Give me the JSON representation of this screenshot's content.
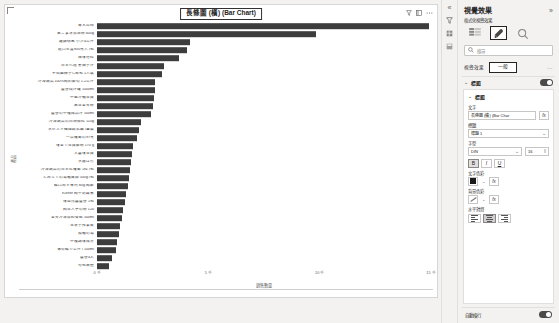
{
  "chart_data": {
    "type": "bar",
    "title": "長條圖 (橫) (Bar Chart)",
    "orientation": "horizontal",
    "xlabel": "銷售數量",
    "ylabel": "產品",
    "xlim": [
      0,
      15000
    ],
    "xticks": [
      "0 千",
      "5 千",
      "10 千",
      "15 千"
    ],
    "grid": false,
    "legend": "none",
    "bar_color": "#3d3d3d",
    "categories": [
      "青木瓜絲",
      "黑ごま冰淇淋粉 600g",
      "鐵鍋燉煮 小沙4公升",
      "進口生薑900克入 /包",
      "辣味噌粒",
      "日本代理 蔥抽子汁",
      "不知園柿子C每包 1入裝",
      "*冷凍蔬菜100%純的鮮筍 1.2公斤",
      "蘆薈燒汁罐 1000ml",
      "中華冷麵豆腐",
      "黑豆全麥粉",
      "蘆薈の甲種成品汁 500ml",
      "*冷凍蔬菜の白胡椒粒 110g",
      "水芒スキ韓國酸乳酪 /盒裝",
      "一品蘿蔔の97克",
      "味全で豆腐鮮粉 170 g",
      "大醬味豆腐",
      "水晶は竹",
      "*冷凍蔬菜の日本紅蘿蔔 1粒 /包",
      "どみなでの湯麵高級 500g /包",
      "糖口みそ專用 80g 純鮮",
      "Kurtler 純牛奶酵素",
      "味自然醬蘆薈 1包",
      "純豆入芋の粉 120",
      "全麥冷凍飲料餐點 500ml",
      "*玉葉手搾果皮",
      "揚麵の湯",
      "甲種調味成分",
      "薄荷糖 /7公升 / 100ml",
      "蘆薈4人",
      "句包無鹽"
    ],
    "values": [
      14900,
      9820,
      4180,
      4030,
      3700,
      3000,
      2900,
      2620,
      2600,
      2560,
      2520,
      2440,
      1980,
      1900,
      1810,
      1620,
      1560,
      1520,
      1480,
      1420,
      1380,
      1300,
      1240,
      1180,
      1120,
      1040,
      980,
      900,
      840,
      680,
      560
    ]
  },
  "canvas": {
    "header_icons": [
      "filter-icon",
      "focus-mode-icon",
      "more-options-icon"
    ]
  },
  "pane": {
    "title": "視覺效果",
    "expand_icon": "»",
    "subtitle": "格式化視覺效果",
    "build_tabs": [
      {
        "name": "fields-icon",
        "label": ""
      },
      {
        "name": "format-paint-icon",
        "label": "",
        "selected": true
      },
      {
        "name": "analytics-magnifier-icon",
        "label": ""
      }
    ],
    "search": {
      "placeholder": "搜尋",
      "icon": "search-icon"
    },
    "tabs": {
      "visual_label": "視覺效果",
      "general_label": "一般",
      "selected": "一般",
      "more": "..."
    },
    "accordion": {
      "label": "標題",
      "chevron": "⌄",
      "toggle_on": true
    },
    "card": {
      "label": "標題",
      "chevron": "⌄",
      "text_label": "文字",
      "text_value": "長條圖 (橫) (Bar Char",
      "fx_label": "fx",
      "heading_label": "標題",
      "heading_value": "標題 1",
      "font_label": "字型",
      "font_family": "DIN",
      "font_size": "16",
      "bold": "B",
      "italic": "I",
      "underline": "U",
      "text_color_label": "文字色彩",
      "bg_color_label": "背景色彩",
      "align_label": "水平對齊",
      "align_selected": "center"
    },
    "footer": {
      "label": "自動換行",
      "toggle_on": true
    }
  },
  "rail": {
    "chevron": "«",
    "icons": [
      "filter-pane-icon",
      "fields-pane-icon",
      "format-pane-icon"
    ]
  }
}
